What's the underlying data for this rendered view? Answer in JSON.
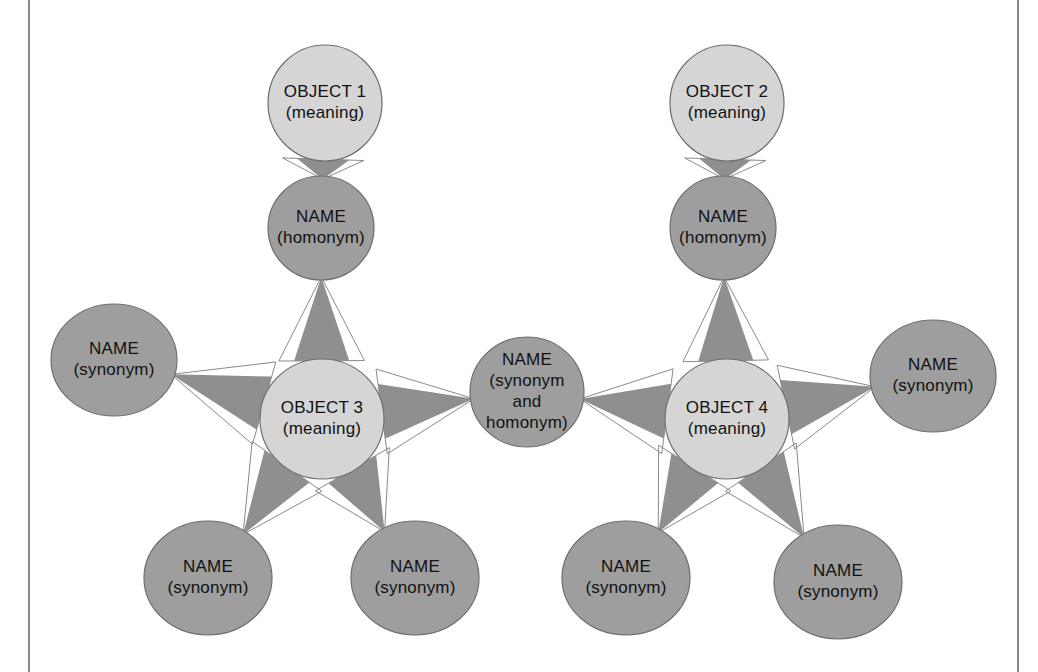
{
  "page": {
    "width": 1038,
    "height": 672,
    "background": "#ffffff"
  },
  "colors": {
    "object_node_fill": "#d5d5d5",
    "name_node_fill": "#9e9e9e",
    "node_stroke": "#6e6e6e",
    "edge_wedge_fill": "#8f8f8f",
    "edge_outline": "#8a8a8a",
    "text": "#111111",
    "rule": "#6b6b6b",
    "page_background": "#ffffff"
  },
  "borders": {
    "left_rule_x": 29,
    "right_rule_x": 1018
  },
  "nodes": [
    {
      "id": "object1",
      "kind": "object",
      "cx": 325,
      "cy": 103,
      "rx": 57,
      "ry": 58,
      "lines": [
        "OBJECT 1",
        "(meaning)"
      ]
    },
    {
      "id": "homonym1",
      "kind": "name",
      "cx": 321,
      "cy": 228,
      "rx": 53,
      "ry": 52,
      "lines": [
        "NAME",
        "(homonym)"
      ]
    },
    {
      "id": "object2",
      "kind": "object",
      "cx": 727,
      "cy": 103,
      "rx": 57,
      "ry": 58,
      "lines": [
        "OBJECT 2",
        "(meaning)"
      ]
    },
    {
      "id": "homonym2",
      "kind": "name",
      "cx": 723,
      "cy": 228,
      "rx": 53,
      "ry": 52,
      "lines": [
        "NAME",
        "(homonym)"
      ]
    },
    {
      "id": "synonym_left_upper",
      "kind": "name",
      "cx": 114,
      "cy": 360,
      "rx": 63,
      "ry": 56,
      "lines": [
        "NAME",
        "(synonym)"
      ]
    },
    {
      "id": "object3",
      "kind": "object",
      "cx": 322,
      "cy": 419,
      "rx": 62,
      "ry": 60,
      "lines": [
        "OBJECT 3",
        "(meaning)"
      ]
    },
    {
      "id": "synonym_center",
      "kind": "name",
      "cx": 527,
      "cy": 392,
      "rx": 57,
      "ry": 55,
      "lines": [
        "NAME",
        "(synonym",
        "and",
        "homonym)"
      ]
    },
    {
      "id": "object4",
      "kind": "object",
      "cx": 727,
      "cy": 419,
      "rx": 62,
      "ry": 60,
      "lines": [
        "OBJECT 4",
        "(meaning)"
      ]
    },
    {
      "id": "synonym_right_upper",
      "kind": "name",
      "cx": 933,
      "cy": 376,
      "rx": 63,
      "ry": 56,
      "lines": [
        "NAME",
        "(synonym)"
      ]
    },
    {
      "id": "synonym_left_lower_a",
      "kind": "name",
      "cx": 208,
      "cy": 578,
      "rx": 64,
      "ry": 57,
      "lines": [
        "NAME",
        "(synonym)"
      ]
    },
    {
      "id": "synonym_left_lower_b",
      "kind": "name",
      "cx": 415,
      "cy": 578,
      "rx": 64,
      "ry": 57,
      "lines": [
        "NAME",
        "(synonym)"
      ]
    },
    {
      "id": "synonym_right_lower_a",
      "kind": "name",
      "cx": 626,
      "cy": 578,
      "rx": 64,
      "ry": 57,
      "lines": [
        "NAME",
        "(synonym)"
      ]
    },
    {
      "id": "synonym_right_lower_b",
      "kind": "name",
      "cx": 838,
      "cy": 582,
      "rx": 64,
      "ry": 57,
      "lines": [
        "NAME",
        "(synonym)"
      ]
    }
  ],
  "edges": [
    {
      "id": "e1",
      "from": "object1",
      "to": "homonym1",
      "relation": "names"
    },
    {
      "id": "e2",
      "from": "object3",
      "to": "homonym1",
      "relation": "names"
    },
    {
      "id": "e3",
      "from": "object2",
      "to": "homonym2",
      "relation": "names"
    },
    {
      "id": "e4",
      "from": "object4",
      "to": "homonym2",
      "relation": "names"
    },
    {
      "id": "e5",
      "from": "object3",
      "to": "synonym_left_upper",
      "relation": "names"
    },
    {
      "id": "e6",
      "from": "object3",
      "to": "synonym_center",
      "relation": "names"
    },
    {
      "id": "e7",
      "from": "object3",
      "to": "synonym_left_lower_a",
      "relation": "names"
    },
    {
      "id": "e8",
      "from": "object3",
      "to": "synonym_left_lower_b",
      "relation": "names"
    },
    {
      "id": "e9",
      "from": "object4",
      "to": "synonym_center",
      "relation": "names"
    },
    {
      "id": "e10",
      "from": "object4",
      "to": "synonym_right_upper",
      "relation": "names"
    },
    {
      "id": "e11",
      "from": "object4",
      "to": "synonym_right_lower_a",
      "relation": "names"
    },
    {
      "id": "e12",
      "from": "object4",
      "to": "synonym_right_lower_b",
      "relation": "names"
    }
  ]
}
